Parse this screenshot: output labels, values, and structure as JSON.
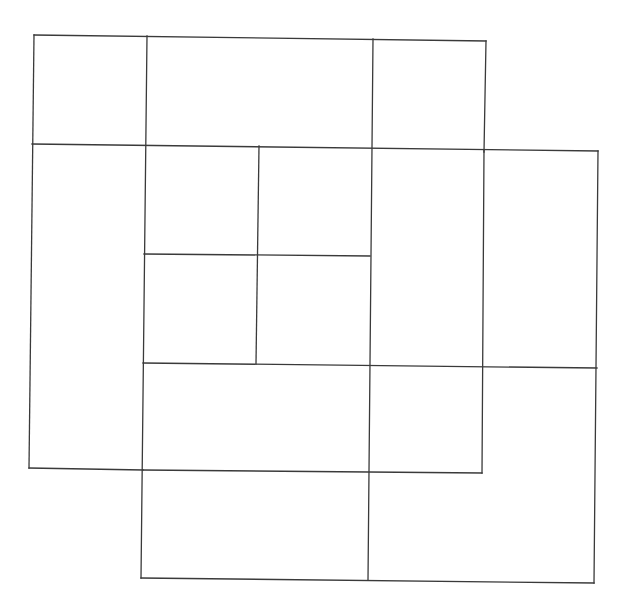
{
  "diagram": {
    "title": "",
    "canvas": {
      "width": 627,
      "height": 613,
      "background": "#ffffff"
    },
    "stroke": {
      "color": "#3a3a3a",
      "width": 1.3
    },
    "lines": [
      {
        "id": "A-top",
        "x1": 34,
        "y1": 35,
        "x2": 486,
        "y2": 41
      },
      {
        "id": "A-left",
        "x1": 34,
        "y1": 35,
        "x2": 29,
        "y2": 468
      },
      {
        "id": "A-right-upper",
        "x1": 486,
        "y1": 41,
        "x2": 484,
        "y2": 152
      },
      {
        "id": "A-bottom-left",
        "x1": 29,
        "y1": 468,
        "x2": 143,
        "y2": 470
      },
      {
        "id": "A-h1",
        "x1": 32,
        "y1": 144,
        "x2": 598,
        "y2": 151
      },
      {
        "id": "v-147",
        "x1": 147,
        "y1": 36,
        "x2": 141,
        "y2": 578
      },
      {
        "id": "v-373",
        "x1": 373,
        "y1": 39,
        "x2": 368,
        "y2": 580
      },
      {
        "id": "v-259",
        "x1": 259,
        "y1": 146,
        "x2": 256,
        "y2": 364
      },
      {
        "id": "h-255",
        "x1": 144,
        "y1": 254,
        "x2": 370,
        "y2": 256
      },
      {
        "id": "h-364",
        "x1": 143,
        "y1": 363,
        "x2": 597,
        "y2": 368
      },
      {
        "id": "v-485",
        "x1": 484,
        "y1": 150,
        "x2": 482,
        "y2": 473
      },
      {
        "id": "A-bottom-right",
        "x1": 143,
        "y1": 470,
        "x2": 482,
        "y2": 473
      },
      {
        "id": "B-right",
        "x1": 598,
        "y1": 151,
        "x2": 594,
        "y2": 583
      },
      {
        "id": "B-bottom",
        "x1": 141,
        "y1": 578,
        "x2": 594,
        "y2": 583
      }
    ],
    "squares": [
      {
        "name": "square-A",
        "corners": [
          [
            34,
            35
          ],
          [
            486,
            41
          ],
          [
            482,
            473
          ],
          [
            29,
            468
          ]
        ]
      },
      {
        "name": "square-B",
        "corners": [
          [
            146,
            144
          ],
          [
            598,
            151
          ],
          [
            594,
            583
          ],
          [
            141,
            578
          ]
        ]
      }
    ]
  }
}
